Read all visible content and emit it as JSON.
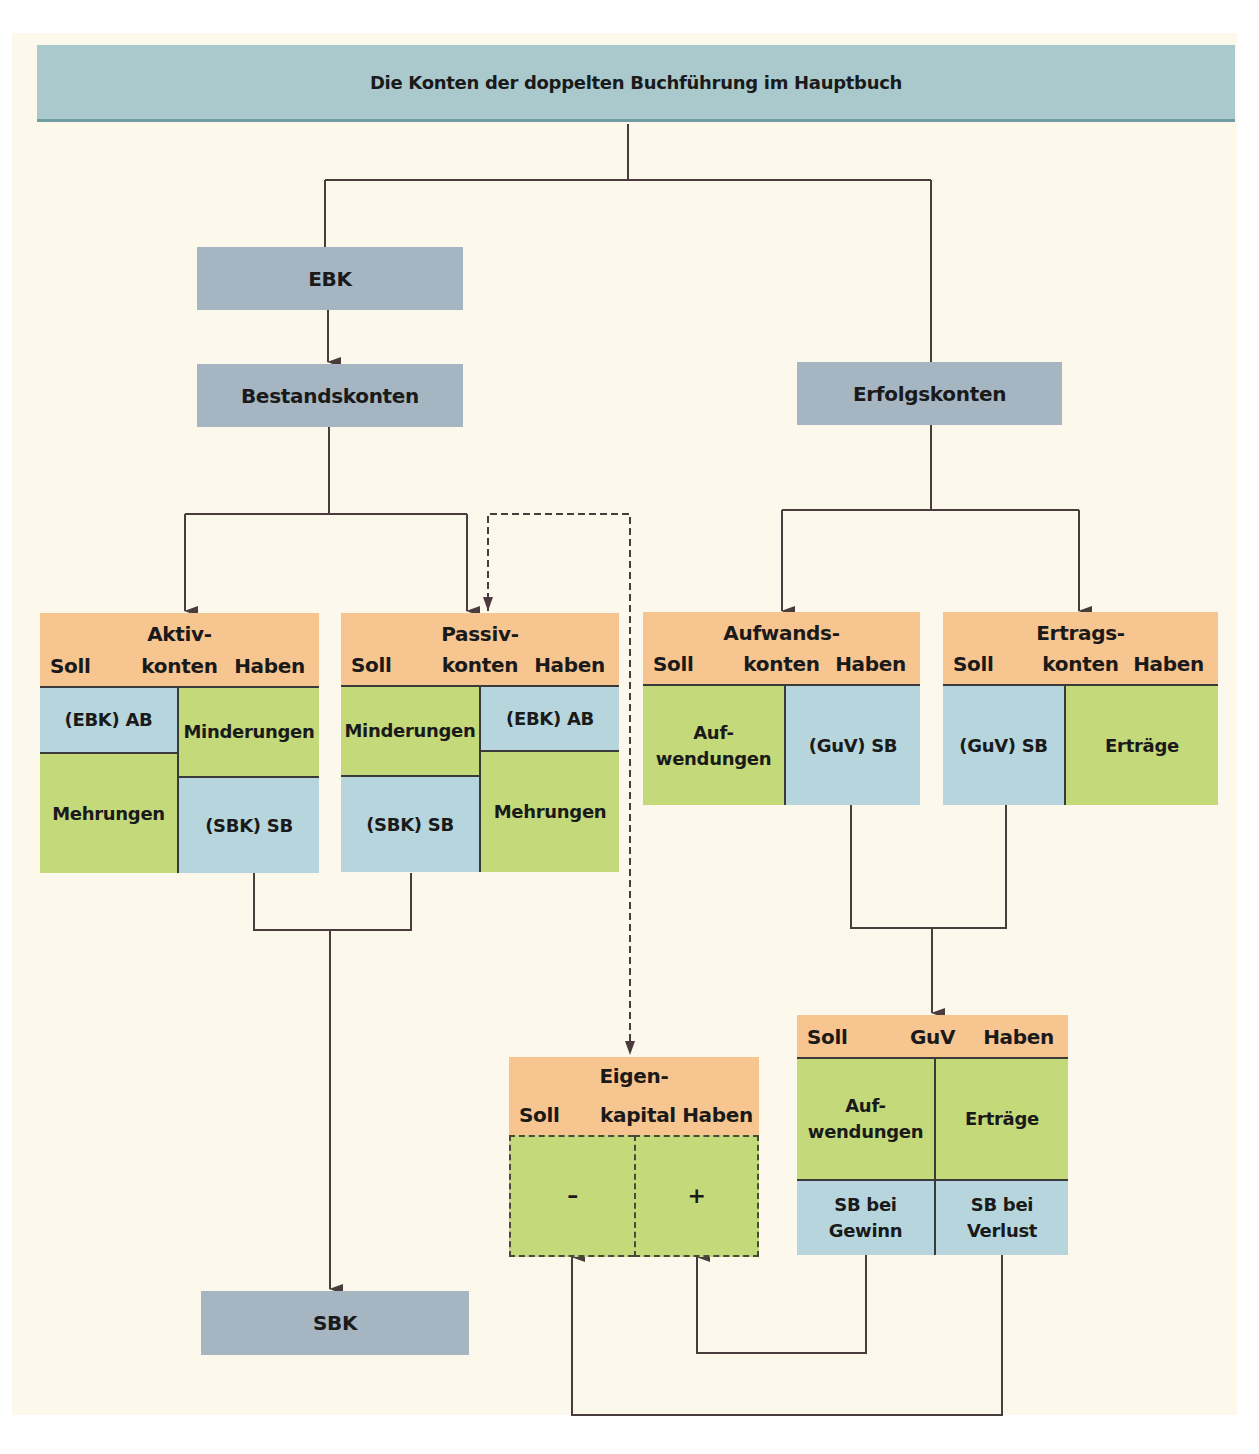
{
  "title": "Die Konten der doppelten Buchführung im Hauptbuch",
  "nodes": {
    "ebk": "EBK",
    "bestandskonten": "Bestandskonten",
    "erfolgskonten": "Erfolgskonten",
    "sbk": "SBK"
  },
  "accounts": {
    "aktiv": {
      "name_line1": "Aktiv-",
      "name_line2": "konten",
      "soll": "Soll",
      "haben": "Haben",
      "soll_cells": [
        "(EBK) AB",
        "Mehrungen"
      ],
      "haben_cells": [
        "Minderungen",
        "(SBK) SB"
      ]
    },
    "passiv": {
      "name_line1": "Passiv-",
      "name_line2": "konten",
      "soll": "Soll",
      "haben": "Haben",
      "soll_cells": [
        "Minderungen",
        "(SBK) SB"
      ],
      "haben_cells": [
        "(EBK) AB",
        "Mehrungen"
      ]
    },
    "aufwand": {
      "name_line1": "Aufwands-",
      "name_line2": "konten",
      "soll": "Soll",
      "haben": "Haben",
      "soll_cell_line1": "Auf-",
      "soll_cell_line2": "wendungen",
      "haben_cell": "(GuV) SB"
    },
    "ertrag": {
      "name_line1": "Ertrags-",
      "name_line2": "konten",
      "soll": "Soll",
      "haben": "Haben",
      "soll_cell": "(GuV) SB",
      "haben_cell": "Erträge"
    },
    "eigenkapital": {
      "name_line1": "Eigen-",
      "name_line2": "kapital",
      "soll": "Soll",
      "haben": "Haben",
      "soll_cell": "–",
      "haben_cell": "+"
    },
    "guv": {
      "name": "GuV",
      "soll": "Soll",
      "haben": "Haben",
      "soll_cell_line1": "Auf-",
      "soll_cell_line2": "wendungen",
      "haben_cell": "Erträge",
      "soll_sb_line1": "SB bei",
      "soll_sb_line2": "Gewinn",
      "haben_sb_line1": "SB bei",
      "haben_sb_line2": "Verlust"
    }
  },
  "colors": {
    "title_bg": "#a9c9cd",
    "node_bg": "#a5b6c2",
    "header_bg": "#f7c590",
    "balance_bg": "#b6d5dc",
    "entry_bg": "#c4d97a",
    "page_bg": "#fdf8ec",
    "line": "#4a3c3c"
  }
}
